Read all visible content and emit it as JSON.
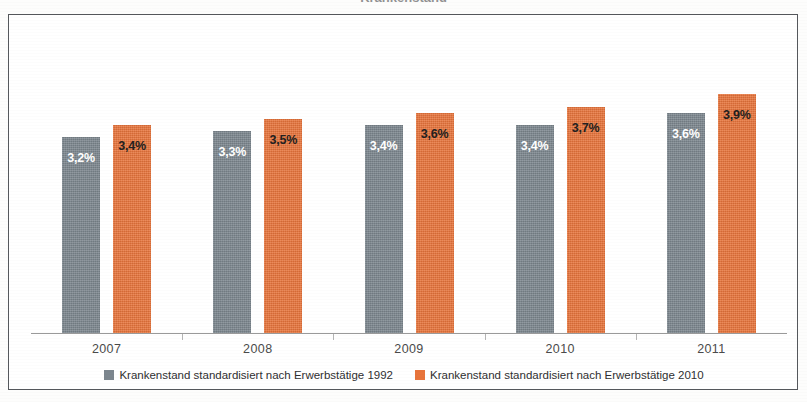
{
  "page": {
    "title_remnant": "Krankenstand",
    "frame_border_color": "#55585c",
    "background_color": "#ffffff"
  },
  "chart_data": {
    "type": "bar",
    "title": "",
    "subtitle": "",
    "xlabel": "",
    "ylabel": "",
    "categories": [
      "2007",
      "2008",
      "2009",
      "2010",
      "2011"
    ],
    "series": [
      {
        "name": "Krankenstand standardisiert nach Erwerbstätige 1992",
        "color": "#7c868e",
        "values": [
          3.2,
          3.3,
          3.4,
          3.4,
          3.6
        ],
        "labels": [
          "3,2%",
          "3,3%",
          "3,4%",
          "3,4%",
          "3,6%"
        ]
      },
      {
        "name": "Krankenstand standardisiert nach Erwerbstätige 2010",
        "color": "#e8743b",
        "values": [
          3.4,
          3.5,
          3.6,
          3.7,
          3.9
        ],
        "labels": [
          "3,4%",
          "3,5%",
          "3,6%",
          "3,7%",
          "3,9%"
        ]
      }
    ],
    "ylim": [
      0,
      5.0
    ],
    "grid": false,
    "legend_position": "bottom",
    "value_unit": "%",
    "decimal_separator": ","
  },
  "axis": {
    "tick_labels": [
      "2007",
      "2008",
      "2009",
      "2010",
      "2011"
    ],
    "line_color": "#9a9a9a"
  },
  "legend": {
    "items": [
      {
        "label": "Krankenstand standardisiert nach Erwerbstätige 1992",
        "color": "#7c868e"
      },
      {
        "label": "Krankenstand standardisiert nach Erwerbstätige 2010",
        "color": "#e8743b"
      }
    ]
  }
}
